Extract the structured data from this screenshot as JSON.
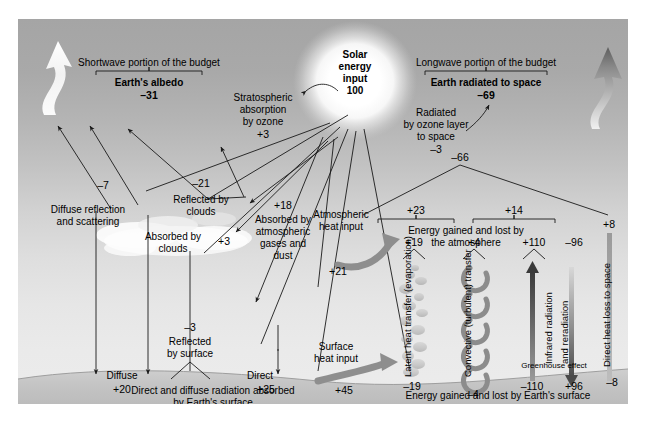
{
  "figure": {
    "units_note": "values are percent of incoming solar energy"
  },
  "colors": {
    "sky_top": "#a5a5a5",
    "sky_bottom": "#ececec",
    "ground": "#c6c6c6",
    "line": "#1a1a1a",
    "arrow_gray": "#8c8c8c",
    "arrow_dark": "#5a5a5a",
    "sun_glow": "#ffffff"
  },
  "sun": {
    "line1": "Solar",
    "line2": "energy",
    "line3": "input",
    "value": "100"
  },
  "shortwave": {
    "heading": "Shortwave portion of the budget",
    "subheading": "Earth's albedo",
    "albedo_value": "–31",
    "diffuse_reflection": {
      "line1": "Diffuse reflection",
      "line2": "and scattering",
      "value": "–7"
    },
    "reflected_by_clouds": {
      "line1": "Reflected by",
      "line2": "clouds",
      "value": "–21"
    },
    "stratospheric": {
      "line1": "Stratospheric",
      "line2": "absorption",
      "line3": "by ozone",
      "value": "+3"
    },
    "absorbed_by_clouds": {
      "line1": "Absorbed by",
      "line2": "clouds",
      "value": "+3"
    },
    "absorbed_by_gases": {
      "line1": "Absorbed by",
      "line2": "atmospheric",
      "line3": "gases and",
      "line4": "dust",
      "value": "+18"
    },
    "reflected_by_surface": {
      "line1": "Reflected",
      "line2": "by surface",
      "value": "–3"
    },
    "diffuse_surface": {
      "label": "Diffuse",
      "value": "+20"
    },
    "direct_surface": {
      "label": "Direct",
      "value": "+25"
    },
    "surface_absorbed_caption": {
      "line1": "Direct and diffuse radiation absorbed",
      "line2": "by Earth's surface"
    }
  },
  "longwave": {
    "heading": "Longwave portion of the budget",
    "subheading": "Earth radiated to space",
    "radiated_value": "–69",
    "ozone_radiated": {
      "line1": "Radiated",
      "line2": "by ozone layer",
      "line3": "to space",
      "value": "–3"
    },
    "atmosphere_total": "–66",
    "branch_left_value": "+23",
    "branch_right_value": "+14",
    "branch_far_right_value": "+8",
    "atmosphere_caption": {
      "line1": "Energy gained and lost by",
      "line2": "the atmosphere"
    },
    "atmospheric_heat_input": {
      "line1": "Atmospheric",
      "line2": "heat input",
      "value": "+21"
    },
    "surface_heat_input": {
      "line1": "Surface",
      "line2": "heat input",
      "value": "+45"
    },
    "columns": [
      {
        "name": "latent-heat",
        "vertical_label": "Latent heat transfer (evaporation)",
        "top_value": "+19",
        "bottom_value": "–19"
      },
      {
        "name": "convective-transfer",
        "vertical_label": "Convective (turbulent) transfer",
        "top_value": "+4",
        "bottom_value": "–4"
      },
      {
        "name": "infrared-up",
        "vertical_label": "Infrared radiation",
        "top_value": "+110",
        "bottom_value": "–110"
      },
      {
        "name": "infrared-down",
        "vertical_label": "and reradiation",
        "top_value": "–96",
        "bottom_value": "+96"
      },
      {
        "name": "direct-heat-loss",
        "vertical_label": "Direct heat loss to space",
        "top_value": "+8",
        "bottom_value": "–8"
      }
    ],
    "greenhouse_label": "Greenhouse effect",
    "surface_caption": "Energy gained and lost by Earth's surface"
  }
}
